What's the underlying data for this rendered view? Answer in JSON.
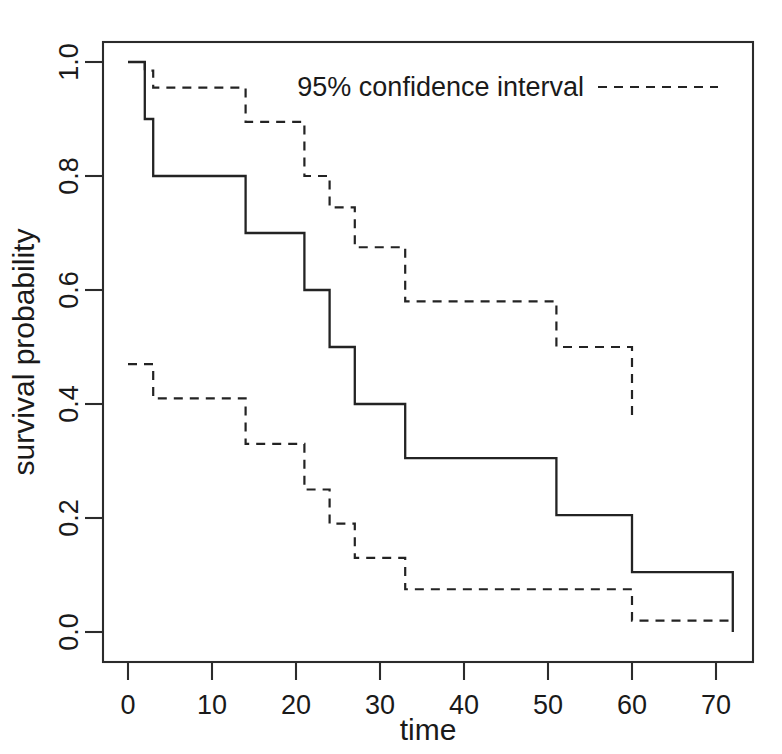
{
  "chart_data": {
    "type": "line",
    "title": "",
    "xlabel": "time",
    "ylabel": "survival probability",
    "xlim": [
      -2,
      76
    ],
    "ylim": [
      -0.035,
      1.04
    ],
    "xticks": [
      0,
      10,
      20,
      30,
      40,
      50,
      60,
      70
    ],
    "xtick_labels": [
      "0",
      "10",
      "20",
      "30",
      "40",
      "50",
      "60",
      "70"
    ],
    "yticks": [
      0.0,
      0.2,
      0.4,
      0.6,
      0.8,
      1.0
    ],
    "ytick_labels": [
      "0.0",
      "0.2",
      "0.4",
      "0.6",
      "0.8",
      "1.0"
    ],
    "grid": false,
    "legend_position": "top-right",
    "legend": [
      {
        "label": "95% confidence interval",
        "style": "dashed"
      }
    ],
    "series": [
      {
        "name": "Kaplan-Meier survival estimate",
        "style": "solid-step",
        "x": [
          0,
          2,
          2,
          3,
          3,
          14,
          14,
          21,
          21,
          24,
          24,
          27,
          27,
          33,
          33,
          51,
          51,
          60,
          60,
          72,
          72
        ],
        "y": [
          1.0,
          1.0,
          0.9,
          0.9,
          0.8,
          0.8,
          0.7,
          0.7,
          0.6,
          0.6,
          0.5,
          0.5,
          0.4,
          0.4,
          0.305,
          0.305,
          0.205,
          0.205,
          0.105,
          0.105,
          0.0
        ]
      },
      {
        "name": "upper 95% confidence limit",
        "style": "dashed-step",
        "x": [
          0,
          2,
          2,
          3,
          3,
          14,
          14,
          21,
          21,
          24,
          24,
          27,
          27,
          33,
          33,
          51,
          51,
          60,
          60
        ],
        "y": [
          1.0,
          1.0,
          0.985,
          0.985,
          0.955,
          0.955,
          0.895,
          0.895,
          0.8,
          0.8,
          0.745,
          0.745,
          0.675,
          0.675,
          0.58,
          0.58,
          0.5,
          0.5,
          0.37
        ]
      },
      {
        "name": "lower 95% confidence limit",
        "style": "dashed-step",
        "x": [
          0,
          3,
          3,
          14,
          14,
          21,
          21,
          24,
          24,
          27,
          27,
          33,
          33,
          60,
          60,
          72
        ],
        "y": [
          0.47,
          0.47,
          0.41,
          0.41,
          0.33,
          0.33,
          0.25,
          0.25,
          0.19,
          0.19,
          0.13,
          0.13,
          0.075,
          0.075,
          0.02,
          0.02
        ]
      }
    ]
  },
  "axes": {
    "x_title": "time",
    "y_title": "survival probability",
    "x_tick_labels": [
      "0",
      "10",
      "20",
      "30",
      "40",
      "50",
      "60",
      "70"
    ],
    "y_tick_labels": [
      "0.0",
      "0.2",
      "0.4",
      "0.6",
      "0.8",
      "1.0"
    ]
  },
  "legend": {
    "confidence_label": "95% confidence interval"
  },
  "colors": {
    "line": "#232323",
    "axis": "#2b2b2b",
    "background": "#ffffff"
  }
}
